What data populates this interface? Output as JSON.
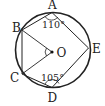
{
  "diagram": {
    "type": "geometry",
    "colors": {
      "stroke": "#222222",
      "background": "#ffffff"
    },
    "circle": {
      "center_label": "O"
    },
    "points": [
      {
        "label": "A"
      },
      {
        "label": "B"
      },
      {
        "label": "C"
      },
      {
        "label": "D"
      },
      {
        "label": "E"
      }
    ],
    "angles": {
      "at_A": "110°",
      "at_D": "105°"
    }
  }
}
